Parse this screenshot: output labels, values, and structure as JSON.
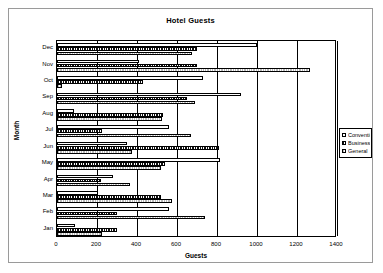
{
  "chart_data": {
    "type": "bar",
    "orientation": "horizontal",
    "title": "Hotel Guests",
    "xlabel": "Guests",
    "ylabel": "Month",
    "xlim": [
      0,
      1400
    ],
    "xticks": [
      0,
      200,
      400,
      600,
      800,
      1000,
      1200,
      1400
    ],
    "grid": true,
    "legend_position": "right",
    "categories": [
      "Jan",
      "Feb",
      "Mar",
      "Apr",
      "May",
      "Jun",
      "Jul",
      "Aug",
      "Sep",
      "Oct",
      "Nov",
      "Dec"
    ],
    "series": [
      {
        "name": "Convention",
        "values": [
          90,
          560,
          205,
          280,
          815,
          350,
          560,
          85,
          920,
          730,
          410,
          1000
        ]
      },
      {
        "name": "Business",
        "values": [
          300,
          300,
          520,
          220,
          540,
          810,
          225,
          530,
          650,
          430,
          700,
          700
        ]
      },
      {
        "name": "General",
        "values": [
          225,
          740,
          575,
          365,
          520,
          375,
          670,
          525,
          690,
          25,
          1265,
          675
        ]
      }
    ]
  },
  "legend": {
    "entries": [
      {
        "label": "Convention",
        "swatch": "convention"
      },
      {
        "label": "Business",
        "swatch": "business"
      },
      {
        "label": "General",
        "swatch": "general"
      }
    ]
  },
  "colors": {
    "axis": "#000000",
    "frame": "#9a9a9a",
    "background": "#ffffff",
    "convention": "#ffffff",
    "business": "#111111",
    "general": "#b8b8b8"
  }
}
